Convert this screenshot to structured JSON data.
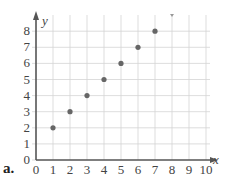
{
  "part_label": "a.",
  "chart_data": {
    "type": "scatter",
    "title": "",
    "xlabel": "x",
    "ylabel": "y",
    "xlim": [
      0,
      10
    ],
    "ylim": [
      0,
      8
    ],
    "grid": true,
    "x_ticks": [
      "0",
      "1",
      "2",
      "3",
      "4",
      "5",
      "6",
      "7",
      "8",
      "9",
      "10"
    ],
    "y_ticks": [
      "0",
      "1",
      "2",
      "3",
      "4",
      "5",
      "6",
      "7",
      "8"
    ],
    "series": [
      {
        "name": "points",
        "x": [
          1,
          2,
          3,
          4,
          5,
          6,
          7
        ],
        "y": [
          2,
          3,
          4,
          5,
          6,
          7,
          8
        ]
      }
    ]
  },
  "colors": {
    "grid": "#d4d4d4",
    "axis": "#555555",
    "point": "#666666"
  }
}
